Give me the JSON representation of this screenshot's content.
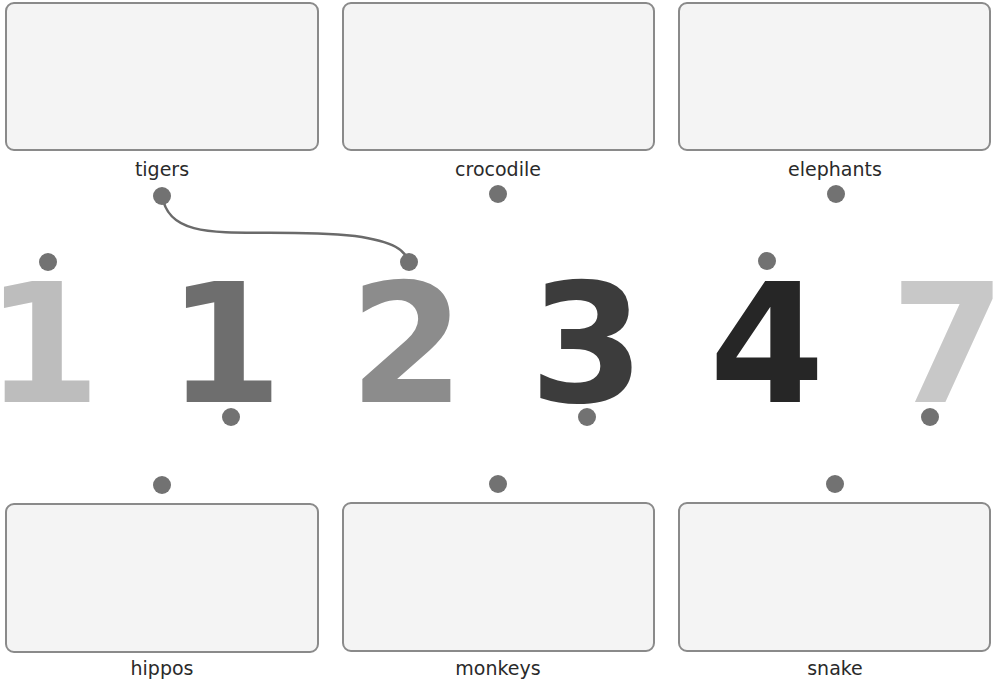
{
  "activity": {
    "type": "match-numbers-to-animals",
    "top_cards": [
      {
        "label": "tigers"
      },
      {
        "label": "crocodile"
      },
      {
        "label": "elephants"
      }
    ],
    "bottom_cards": [
      {
        "label": "hippos"
      },
      {
        "label": "monkeys"
      },
      {
        "label": "snake"
      }
    ],
    "numbers": [
      {
        "value": "1",
        "color": "#bdbdbd",
        "dot": "top"
      },
      {
        "value": "1",
        "color": "#6e6e6e",
        "dot": "bottom"
      },
      {
        "value": "2",
        "color": "#8c8c8c",
        "dot": "top"
      },
      {
        "value": "3",
        "color": "#3c3c3c",
        "dot": "bottom"
      },
      {
        "value": "4",
        "color": "#262626",
        "dot": "top"
      },
      {
        "value": "7",
        "color": "#c8c8c8",
        "dot": "bottom"
      }
    ],
    "connections": [
      {
        "from": "tigers",
        "to_number_index": 2,
        "to_number": "2"
      }
    ]
  },
  "colors": {
    "dot": "#727272",
    "box_border": "#8a8a8a",
    "box_fill": "#f4f4f4",
    "line": "#6a6a6a"
  }
}
